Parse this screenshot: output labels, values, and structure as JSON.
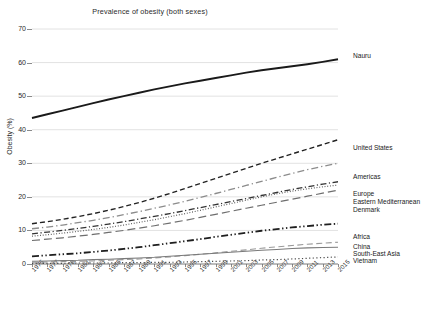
{
  "chart_data": {
    "type": "line",
    "title": "Prevalence of obesity (both sexes)",
    "xlabel": "",
    "ylabel": "Obesity (%)",
    "xlim": [
      1975,
      2015
    ],
    "ylim": [
      0,
      70
    ],
    "ytick_step": 10,
    "grid": true,
    "legend_position": "right-inline-labels",
    "x": [
      1975,
      1977,
      1979,
      1981,
      1983,
      1985,
      1987,
      1989,
      1991,
      1993,
      1995,
      1997,
      1999,
      2001,
      2003,
      2005,
      2007,
      2009,
      2011,
      2013,
      2015
    ],
    "yticks": [
      0,
      10,
      20,
      30,
      40,
      50,
      60,
      70
    ],
    "xticks": [
      "1975",
      "1977",
      "1979",
      "1981",
      "1983",
      "1985",
      "1987",
      "1989",
      "1991",
      "1993",
      "1995",
      "1997",
      "1999",
      "2001",
      "2003",
      "2005",
      "2007",
      "2009",
      "2011",
      "2013",
      "2015"
    ],
    "series": [
      {
        "name": "Nauru",
        "style": "solid",
        "color": "#1a1a1a",
        "width": 1.9,
        "values": [
          43.5,
          44.6,
          45.7,
          46.8,
          47.9,
          49.0,
          50.0,
          51.0,
          52.0,
          52.9,
          53.8,
          54.6,
          55.4,
          56.2,
          57.0,
          57.7,
          58.3,
          58.9,
          59.5,
          60.2,
          61.0
        ]
      },
      {
        "name": "United States",
        "style": "dashed",
        "color": "#222222",
        "width": 1.4,
        "values": [
          12.0,
          12.6,
          13.3,
          14.1,
          15.0,
          16.0,
          17.1,
          18.3,
          19.6,
          21.0,
          22.5,
          24.0,
          25.5,
          27.0,
          28.5,
          30.0,
          31.4,
          32.8,
          34.2,
          35.6,
          37.0
        ]
      },
      {
        "name": "Americas",
        "style": "dashdot-light",
        "color": "#8c8c8c",
        "width": 1.3,
        "values": [
          10.5,
          11.0,
          11.6,
          12.3,
          13.0,
          13.8,
          14.7,
          15.6,
          16.6,
          17.6,
          18.7,
          19.8,
          21.0,
          22.2,
          23.4,
          24.6,
          25.8,
          27.0,
          28.1,
          29.1,
          30.0
        ]
      },
      {
        "name": "Europe",
        "style": "dashdot",
        "color": "#333333",
        "width": 1.3,
        "values": [
          9.0,
          9.5,
          10.0,
          10.6,
          11.2,
          11.9,
          12.6,
          13.4,
          14.2,
          15.0,
          15.9,
          16.8,
          17.7,
          18.6,
          19.5,
          20.4,
          21.3,
          22.2,
          23.0,
          23.8,
          24.5
        ]
      },
      {
        "name": "Eastern Mediterranean",
        "style": "dotted-fine",
        "color": "#555555",
        "width": 1.2,
        "values": [
          8.3,
          8.7,
          9.2,
          9.7,
          10.3,
          10.9,
          11.6,
          12.4,
          13.2,
          14.1,
          15.0,
          16.0,
          17.0,
          18.0,
          19.0,
          20.0,
          20.9,
          21.7,
          22.4,
          23.0,
          23.5
        ]
      },
      {
        "name": "Denmark",
        "style": "longdash",
        "color": "#6e6e6e",
        "width": 1.2,
        "values": [
          7.0,
          7.4,
          7.8,
          8.3,
          8.8,
          9.4,
          10.0,
          10.7,
          11.4,
          12.2,
          13.0,
          13.9,
          14.8,
          15.7,
          16.6,
          17.5,
          18.4,
          19.3,
          20.2,
          21.1,
          22.0
        ]
      },
      {
        "name": "Africa",
        "style": "dashdotdot-bold",
        "color": "#1f1f1f",
        "width": 1.8,
        "values": [
          2.3,
          2.6,
          2.9,
          3.2,
          3.6,
          4.0,
          4.5,
          5.0,
          5.6,
          6.2,
          6.8,
          7.4,
          8.1,
          8.7,
          9.3,
          9.9,
          10.4,
          10.9,
          11.3,
          11.7,
          12.0
        ]
      },
      {
        "name": "China",
        "style": "dashed-light",
        "color": "#9a9a9a",
        "width": 1.1,
        "values": [
          0.5,
          0.6,
          0.7,
          0.8,
          0.9,
          1.1,
          1.3,
          1.5,
          1.8,
          2.1,
          2.5,
          2.9,
          3.3,
          3.8,
          4.2,
          4.7,
          5.1,
          5.5,
          5.9,
          6.2,
          6.5
        ]
      },
      {
        "name": "South-East Asia",
        "style": "solid-thin",
        "color": "#7a7a7a",
        "width": 1.1,
        "values": [
          0.8,
          0.9,
          1.0,
          1.1,
          1.3,
          1.4,
          1.6,
          1.8,
          2.0,
          2.3,
          2.6,
          2.9,
          3.2,
          3.5,
          3.8,
          4.1,
          4.3,
          4.6,
          4.8,
          4.9,
          5.0
        ]
      },
      {
        "name": "Vietnam",
        "style": "dotted",
        "color": "#4a4a4a",
        "width": 1.2,
        "values": [
          0.2,
          0.2,
          0.2,
          0.3,
          0.3,
          0.3,
          0.4,
          0.4,
          0.5,
          0.5,
          0.6,
          0.7,
          0.8,
          0.9,
          1.0,
          1.2,
          1.3,
          1.5,
          1.7,
          1.9,
          2.1
        ]
      }
    ],
    "inline_labels": [
      {
        "text": "Nauru",
        "x": 353,
        "y": 52
      },
      {
        "text": "United States",
        "x": 353,
        "y": 144
      },
      {
        "text": "Americas",
        "x": 353,
        "y": 173
      },
      {
        "text": "Europe",
        "x": 353,
        "y": 190
      },
      {
        "text": "Eastern Mediterranean",
        "x": 353,
        "y": 198
      },
      {
        "text": "South-East Asia",
        "x": 353,
        "y": 250
      },
      {
        "text": "Denmark",
        "x": 353,
        "y": 206
      },
      {
        "text": "Africa",
        "x": 353,
        "y": 233
      },
      {
        "text": "China",
        "x": 353,
        "y": 243
      },
      {
        "text": "Vietnam",
        "x": 353,
        "y": 257
      }
    ]
  }
}
